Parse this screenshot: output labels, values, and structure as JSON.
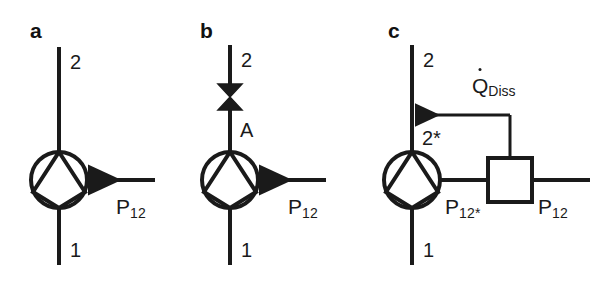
{
  "figure": {
    "background": "#ffffff",
    "stroke_color": "#1a1a1a",
    "width": 604,
    "height": 282
  },
  "panels": [
    {
      "id": "a",
      "letter": "a",
      "description": "Ideal pump with shaft power input",
      "labels": {
        "outlet": "2",
        "inlet": "1",
        "power": {
          "base": "P",
          "sub": "12"
        }
      },
      "components": [
        "vertical-pipe",
        "pump-symbol",
        "power-arrow"
      ]
    },
    {
      "id": "b",
      "letter": "b",
      "description": "Pump with throttling valve at outlet",
      "labels": {
        "outlet": "2",
        "inlet": "1",
        "valve_node": "A",
        "power": {
          "base": "P",
          "sub": "12"
        }
      },
      "components": [
        "vertical-pipe",
        "valve-symbol",
        "pump-symbol",
        "power-arrow"
      ]
    },
    {
      "id": "c",
      "letter": "c",
      "description": "Pump with dissipation element returning heat flow to the outlet stream",
      "labels": {
        "outlet": "2",
        "inlet": "1",
        "intermediate_state": "2*",
        "heat_flow": {
          "base": "Q",
          "sub": "Diss",
          "dot": true
        },
        "power_internal": {
          "base": "P",
          "sub": "12*"
        },
        "power_external": {
          "base": "P",
          "sub": "12"
        }
      },
      "components": [
        "vertical-pipe",
        "pump-symbol",
        "dissipation-box",
        "heat-arrow",
        "power-line"
      ]
    }
  ]
}
